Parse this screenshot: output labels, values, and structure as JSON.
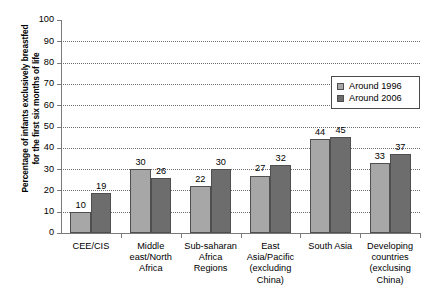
{
  "chart_data": {
    "type": "bar",
    "title": "",
    "xlabel": "",
    "ylabel": "Percentage of infants exclusively breastfed for the first six months of life",
    "ylabel_lines": [
      "Percentage of infants exclusively breastfed",
      "for the first six months of life"
    ],
    "ylim": [
      0,
      100
    ],
    "ytick_labels": [
      "100",
      "90",
      "80",
      "70",
      "60",
      "50",
      "40",
      "30",
      "20",
      "10",
      "0"
    ],
    "ytick_values": [
      100,
      90,
      80,
      70,
      60,
      50,
      40,
      30,
      20,
      10,
      0
    ],
    "grid": true,
    "grid_style": "dotted-horizontal",
    "legend_position": "top-right",
    "categories": [
      "CEE/CIS",
      "Middle east/North Africa",
      "Sub-saharan Africa Regions",
      "East Asia/Pacific (excluding China)",
      "South Asia",
      "Developing countries (exclusing China)"
    ],
    "category_lines": [
      [
        "CEE/CIS"
      ],
      [
        "Middle",
        "east/North",
        "Africa"
      ],
      [
        "Sub-saharan",
        "Africa",
        "Regions"
      ],
      [
        "East",
        "Asia/Pacific",
        "(excluding",
        "China)"
      ],
      [
        "South Asia"
      ],
      [
        "Developing",
        "countries",
        "(exclusing",
        "China)"
      ]
    ],
    "series": [
      {
        "name": "Around 1996",
        "color": "#a7a7a7",
        "values": [
          10,
          30,
          22,
          27,
          44,
          33
        ]
      },
      {
        "name": "Around 2006",
        "color": "#6d6d6d",
        "values": [
          19,
          26,
          30,
          32,
          45,
          37
        ]
      }
    ]
  },
  "legend": {
    "entries": [
      {
        "label": "Around 1996",
        "color": "#a7a7a7"
      },
      {
        "label": "Around 2006",
        "color": "#6d6d6d"
      }
    ]
  },
  "colors": {
    "series_1996": "#a7a7a7",
    "series_2006": "#6d6d6d",
    "bar_outline": "#4f4f4f",
    "axis": "#7a7a7a",
    "gridline": "#6f6f6f",
    "background": "#ffffff",
    "text": "#000000"
  }
}
